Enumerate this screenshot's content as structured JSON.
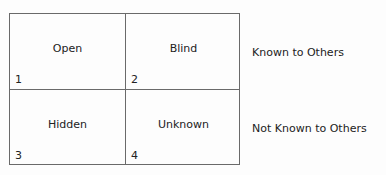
{
  "matrix": {
    "cells": [
      {
        "number": "1",
        "label": "Open"
      },
      {
        "number": "2",
        "label": "Blind"
      },
      {
        "number": "3",
        "label": "Hidden"
      },
      {
        "number": "4",
        "label": "Unknown"
      }
    ],
    "row_labels": [
      "Known to Others",
      "Not Known to Others"
    ]
  },
  "colors": {
    "line": "#6a6a6a",
    "text": "#222222",
    "background": "#fdfdfd"
  }
}
